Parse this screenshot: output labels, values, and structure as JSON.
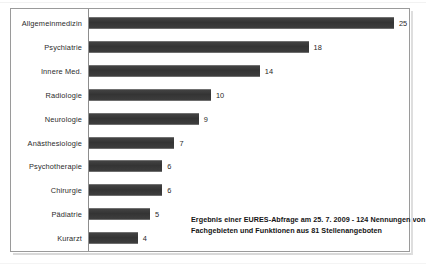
{
  "chart_data": {
    "type": "bar",
    "orientation": "horizontal",
    "title": "",
    "subtitle": "",
    "xlabel": "",
    "ylabel": "",
    "grid": false,
    "legend": null,
    "xlim": [
      0,
      26
    ],
    "categories": [
      "Allgemeinmedizin",
      "Psychiatrie",
      "Innere Med.",
      "Radiologie",
      "Neurologie",
      "Anästhesiologie",
      "Psychotherapie",
      "Chirurgie",
      "Pädiatrie",
      "Kurarzt"
    ],
    "values": [
      25,
      18,
      14,
      10,
      9,
      7,
      6,
      6,
      5,
      4
    ],
    "data_labels": [
      "25",
      "18",
      "14",
      "10",
      "9",
      "7",
      "6",
      "6",
      "5",
      "4"
    ],
    "bar_color": "#3b3b3b",
    "annotation": {
      "line1": "Ergebnis einer EURES-Abfrage am 25. 7. 2009 - 124 Nennungen von",
      "line2": "Fachgebieten und Funktionen aus 81 Stellenangeboten"
    }
  },
  "frame": {
    "border_color": "#9a9a9a",
    "background": "#ffffff"
  }
}
